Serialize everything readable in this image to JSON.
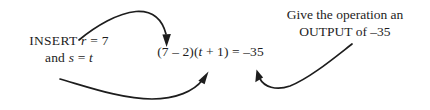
{
  "diagram": {
    "background_color": "#ffffff",
    "ink_color": "#1d1d1d",
    "labels": {
      "insert": {
        "line1_prefix": "INSERT ",
        "line1_var": "r",
        "line1_suffix": " = 7",
        "line2_prefix": "and ",
        "line2_var1": "s",
        "line2_mid": " = ",
        "line2_var2": "t"
      },
      "equation": {
        "part1": "(7 – 2)(",
        "var": "t",
        "part2": " + 1) = –35"
      },
      "output": {
        "line1": "Give the operation an",
        "line2": "OUTPUT of –35"
      }
    },
    "arrows": [
      {
        "name": "insert-to-equation-top-arrow",
        "from": "INSERT r = 7",
        "to": "(7 – 2) term",
        "direction": "down"
      },
      {
        "name": "insert-to-equation-bottom-arrow",
        "from": "and s = t",
        "to": "(t + 1) term",
        "direction": "up-right"
      },
      {
        "name": "output-to-equation-arrow",
        "from": "OUTPUT of –35",
        "to": "= –35 result",
        "direction": "up-left"
      }
    ]
  }
}
